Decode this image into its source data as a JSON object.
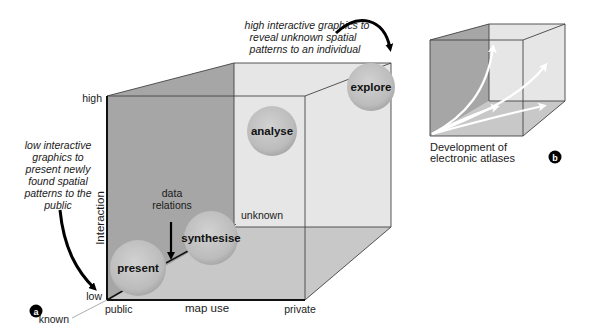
{
  "figure": {
    "panel_a": {
      "badge": "a",
      "axes": {
        "y_axis_label": "Interaction",
        "y_high": "high",
        "y_low": "low",
        "x_axis_label": "map use",
        "x_start": "public",
        "x_end": "private",
        "z_start": "known",
        "z_end": "unknown"
      },
      "bubbles": [
        {
          "label": "present"
        },
        {
          "label": "synthesise"
        },
        {
          "label": "analyse"
        },
        {
          "label": "explore"
        }
      ],
      "annotations": {
        "top_right": [
          "high interactive graphics to",
          "reveal unknown spatial",
          "patterns to an individual"
        ],
        "left": [
          "low interactive",
          "graphics to",
          "present newly",
          "found spatial",
          "patterns to the",
          "public"
        ],
        "data_relations": [
          "data",
          "relations"
        ]
      }
    },
    "panel_b": {
      "badge": "b",
      "caption": [
        "Development of",
        "electronic atlases"
      ]
    },
    "colors": {
      "left_face": "#a6a6a6",
      "back_face": "#e6e6e6",
      "bottom_face": "#c8c8c8",
      "bubble_fill": "#bdbdbd",
      "edge": "#333333"
    }
  }
}
